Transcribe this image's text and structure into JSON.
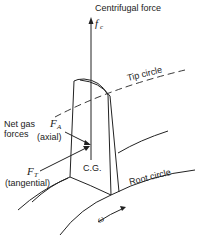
{
  "diagram": {
    "title": "Centrifugal force",
    "fc_symbol": "f",
    "fc_sub": "c",
    "tip_circle_label": "Tip circle",
    "root_circle_label": "Root circle",
    "net_gas_label_1": "Net gas",
    "net_gas_label_2": "forces",
    "fa_symbol": "F",
    "fa_sub": "A",
    "fa_desc": "(axial)",
    "ft_symbol": "F",
    "ft_sub": "T",
    "ft_desc": "(tangential)",
    "cg_label": "C.G.",
    "omega_label": "ω"
  }
}
